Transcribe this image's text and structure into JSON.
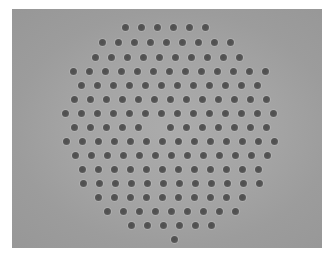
{
  "image": {
    "description": "Grayscale micrograph of a hexagonal array of dark circular holes (photonic-crystal-like cross section) with one missing hole at the center",
    "colors": {
      "page_background": "#ffffff",
      "image_background": "#a4a4a4",
      "hole": "#555555"
    },
    "frame": {
      "x": 12,
      "y": 9,
      "width": 310,
      "height": 239
    },
    "lattice": {
      "hole_diameter": 7,
      "spacing_x": 16,
      "rows": [
        {
          "y": 27,
          "x_start": 125,
          "count": 6
        },
        {
          "y": 42,
          "x_start": 102,
          "count": 9
        },
        {
          "y": 57,
          "x_start": 95,
          "count": 10
        },
        {
          "y": 71,
          "x_start": 73,
          "count": 13
        },
        {
          "y": 85,
          "x_start": 81,
          "count": 12
        },
        {
          "y": 99,
          "x_start": 74,
          "count": 13
        },
        {
          "y": 113,
          "x_start": 65,
          "count": 14
        },
        {
          "y": 127,
          "x_start": 74,
          "count": 13,
          "missing_index": 5
        },
        {
          "y": 141,
          "x_start": 66,
          "count": 14
        },
        {
          "y": 155,
          "x_start": 75,
          "count": 13
        },
        {
          "y": 169,
          "x_start": 82,
          "count": 12
        },
        {
          "y": 183,
          "x_start": 83,
          "count": 12
        },
        {
          "y": 197,
          "x_start": 98,
          "count": 10
        },
        {
          "y": 211,
          "x_start": 107,
          "count": 9
        },
        {
          "y": 225,
          "x_start": 131,
          "count": 6
        },
        {
          "y": 239,
          "x_start": 174,
          "count": 1
        }
      ]
    }
  }
}
